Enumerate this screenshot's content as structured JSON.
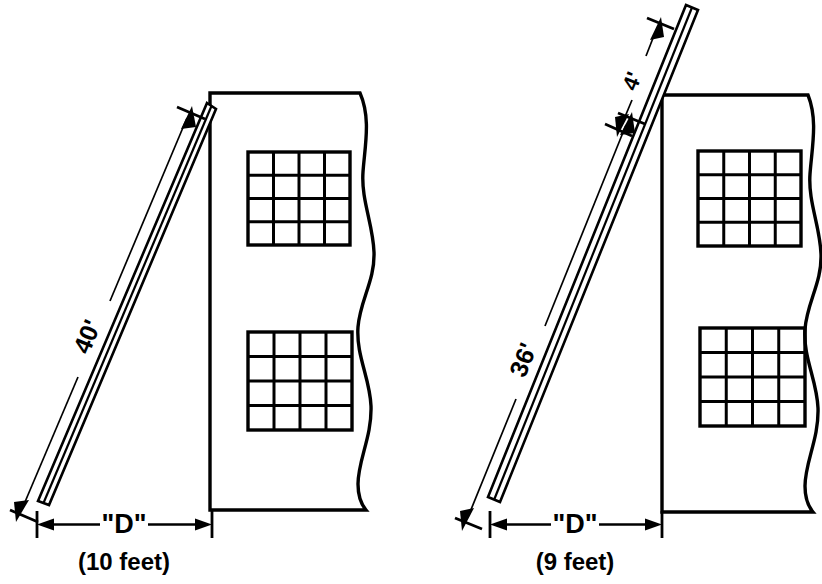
{
  "figure": {
    "ink_color": "#000000",
    "background_color": "#ffffff"
  },
  "panels": [
    {
      "id": "left",
      "name": "ladder-flush-with-wall-top",
      "ladder": {
        "length_label": "40'",
        "extends_above_wall": false,
        "top_extension_label": null
      },
      "base_distance": {
        "symbol_label": "\"D\"",
        "value_label": "(10 feet)"
      }
    },
    {
      "id": "right",
      "name": "ladder-extending-above-wall-top",
      "ladder": {
        "length_label": "36'",
        "extends_above_wall": true,
        "top_extension_label": "4'"
      },
      "base_distance": {
        "symbol_label": "\"D\"",
        "value_label": "(9 feet)"
      }
    }
  ],
  "building": {
    "window_grid_rows": 4,
    "window_grid_cols": 4,
    "windows_per_building": 2,
    "right_edge_style": "break-line"
  }
}
